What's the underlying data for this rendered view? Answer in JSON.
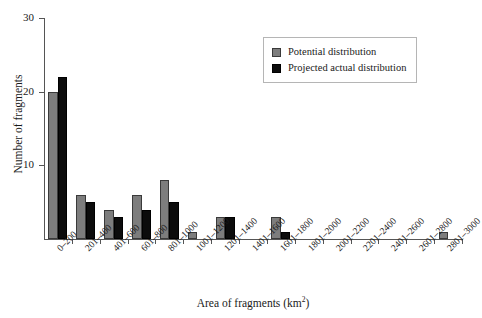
{
  "chart_data": {
    "type": "bar",
    "title": "",
    "xlabel": "Area of fragments (km2)",
    "xlabel_base": "Area of fragments (km",
    "xlabel_sup": "2",
    "xlabel_tail": ")",
    "ylabel": "Number of fragments",
    "ylim": [
      0,
      30
    ],
    "yticks": [
      0,
      10,
      20,
      30
    ],
    "ytick_labels": [
      "",
      "10",
      "20",
      "30"
    ],
    "grid": false,
    "legend_position": "top-right",
    "categories": [
      "0–200",
      "201–400",
      "401–600",
      "601–800",
      "801–1000",
      "1001–1200",
      "1201–1400",
      "1401–1600",
      "1601–1800",
      "1801–2000",
      "2001–2200",
      "2201–2400",
      "2401–2600",
      "2601–2800",
      "2801–3000"
    ],
    "series": [
      {
        "name": "Potential distribution",
        "color": "#7d7d7d",
        "values": [
          20,
          6,
          4,
          6,
          8,
          1,
          3,
          0,
          3,
          0,
          0,
          0,
          0,
          0,
          1
        ]
      },
      {
        "name": "Projected actual distribution",
        "color": "#0c0c0c",
        "values": [
          22,
          5,
          3,
          4,
          5,
          0,
          3,
          0,
          1,
          0,
          0,
          0,
          0,
          0,
          0
        ]
      }
    ]
  },
  "legend": {
    "items": [
      {
        "label": "Potential distribution",
        "swatch": "potential"
      },
      {
        "label": "Projected actual distribution",
        "swatch": "projected"
      }
    ]
  }
}
